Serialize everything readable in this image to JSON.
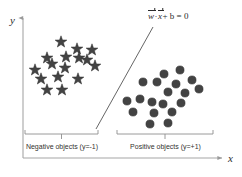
{
  "figure": {
    "background_color": "#ffffff",
    "marker_color": "#434343",
    "axis_color": "#9a9a9a",
    "line_color": "#555555",
    "text_color": "#33322f"
  },
  "axes": {
    "x_label": "x",
    "y_label": "y"
  },
  "hyperplane": {
    "formula_w": "w",
    "formula_dot": "·",
    "formula_x": "x",
    "formula_rest": "+ b = 0",
    "formula_plain": "w⃗ · x⃗ + b = 0"
  },
  "groups": {
    "negative": {
      "label": "Negative objects (y=-1)",
      "marker": "star-marker",
      "count": 16
    },
    "positive": {
      "label": "Positive objects (y=+1)",
      "marker": "dot-marker",
      "count": 19
    }
  },
  "chart_data": {
    "type": "scatter",
    "title": "",
    "xlabel": "x",
    "ylabel": "y",
    "grid": false,
    "legend": false,
    "annotations": [
      {
        "text": "w⃗ · x⃗ + b = 0",
        "x": 152,
        "y": 18
      },
      {
        "text": "Negative objects (y=-1)",
        "x": 62,
        "y": 146
      },
      {
        "text": "Positive objects (y=+1)",
        "x": 165,
        "y": 146
      }
    ],
    "decision_boundary": {
      "x1": 96,
      "y1": 129,
      "x2": 153,
      "y2": 27
    },
    "series": [
      {
        "name": "Negative objects (y=-1)",
        "marker": "star",
        "color": "#434343",
        "points": [
          [
            61,
            42
          ],
          [
            77,
            49
          ],
          [
            92,
            50
          ],
          [
            47,
            58
          ],
          [
            66,
            57
          ],
          [
            79,
            58
          ],
          [
            87,
            60
          ],
          [
            35,
            70
          ],
          [
            52,
            64
          ],
          [
            65,
            68
          ],
          [
            95,
            66
          ],
          [
            41,
            79
          ],
          [
            58,
            77
          ],
          [
            78,
            79
          ],
          [
            47,
            90
          ],
          [
            62,
            90
          ]
        ]
      },
      {
        "name": "Positive objects (y=+1)",
        "marker": "circle",
        "color": "#434343",
        "points": [
          [
            164,
            74
          ],
          [
            180,
            70
          ],
          [
            143,
            82
          ],
          [
            157,
            82
          ],
          [
            176,
            84
          ],
          [
            192,
            80
          ],
          [
            168,
            92
          ],
          [
            185,
            93
          ],
          [
            199,
            89
          ],
          [
            127,
            101
          ],
          [
            140,
            99
          ],
          [
            152,
            102
          ],
          [
            163,
            104
          ],
          [
            181,
            103
          ],
          [
            133,
            112
          ],
          [
            154,
            113
          ],
          [
            172,
            112
          ],
          [
            150,
            124
          ],
          [
            168,
            123
          ]
        ]
      }
    ],
    "brackets": [
      {
        "group": "negative",
        "x_start": 25,
        "x_end": 98,
        "y": 133
      },
      {
        "group": "positive",
        "x_start": 117,
        "x_end": 213,
        "y": 133
      }
    ]
  }
}
